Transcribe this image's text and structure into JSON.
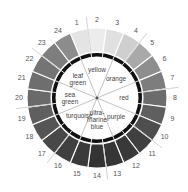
{
  "center": {
    "x": 97,
    "y": 98
  },
  "outer_segments": [
    {
      "n": "1",
      "shade": "#e4e4e4"
    },
    {
      "n": "2",
      "shade": "#ececec"
    },
    {
      "n": "3",
      "shade": "#e0e0e0"
    },
    {
      "n": "4",
      "shade": "#cfcfcf"
    },
    {
      "n": "5",
      "shade": "#a9a9a9"
    },
    {
      "n": "6",
      "shade": "#8e8e8e"
    },
    {
      "n": "7",
      "shade": "#7d7d7d"
    },
    {
      "n": "8",
      "shade": "#6c6c6c"
    },
    {
      "n": "9",
      "shade": "#5f5f5f"
    },
    {
      "n": "10",
      "shade": "#4e4e4e"
    },
    {
      "n": "11",
      "shade": "#404040"
    },
    {
      "n": "12",
      "shade": "#393939"
    },
    {
      "n": "13",
      "shade": "#363636"
    },
    {
      "n": "14",
      "shade": "#333333"
    },
    {
      "n": "15",
      "shade": "#3a3a3a"
    },
    {
      "n": "16",
      "shade": "#404040"
    },
    {
      "n": "17",
      "shade": "#484848"
    },
    {
      "n": "18",
      "shade": "#555555"
    },
    {
      "n": "19",
      "shade": "#5f5f5f"
    },
    {
      "n": "20",
      "shade": "#6a6a6a"
    },
    {
      "n": "21",
      "shade": "#6e6e6e"
    },
    {
      "n": "22",
      "shade": "#747474"
    },
    {
      "n": "23",
      "shade": "#7e7e7e"
    },
    {
      "n": "24",
      "shade": "#8c8c8c"
    }
  ],
  "inner_labels": [
    {
      "lines": [
        "yellow"
      ],
      "angle": -90,
      "r": 28
    },
    {
      "lines": [
        "orange"
      ],
      "angle": -45,
      "r": 27
    },
    {
      "lines": [
        "red"
      ],
      "angle": 0,
      "r": 27
    },
    {
      "lines": [
        "purple"
      ],
      "angle": 45,
      "r": 27
    },
    {
      "lines": [
        "ultra-",
        "marine",
        "blue"
      ],
      "angle": 90,
      "r": 22
    },
    {
      "lines": [
        "turquoise"
      ],
      "angle": 135,
      "r": 25
    },
    {
      "lines": [
        "sea",
        "green"
      ],
      "angle": 180,
      "r": 27
    },
    {
      "lines": [
        "leaf",
        "green"
      ],
      "angle": 225,
      "r": 27
    }
  ],
  "colors": {
    "ring": "#111111",
    "divider": "#ffffff",
    "inner_line": "#9a9a9a",
    "tick_line": "#b5b5b5",
    "center_dot": "#555555"
  }
}
